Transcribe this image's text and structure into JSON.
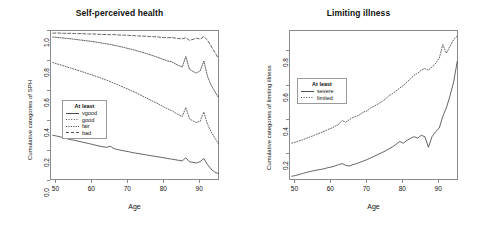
{
  "chart_data": [
    {
      "type": "line",
      "title": "Self-perceived health",
      "xlabel": "Age",
      "ylabel": "Cumulative categories of SPH",
      "xlim": [
        48.5,
        95.5
      ],
      "ylim": [
        0.0,
        1.0
      ],
      "xticks": [
        50,
        60,
        70,
        80,
        90
      ],
      "yticks": [
        "0.0",
        "0.2",
        "0.4",
        "0.6",
        "0.8",
        "1.0"
      ],
      "grid": false,
      "legend": {
        "title": "At least",
        "position": "center-left",
        "entries": [
          {
            "name": "vgood",
            "dash": "none"
          },
          {
            "name": "good",
            "dash": "dotted"
          },
          {
            "name": "fair",
            "dash": "dash-dot"
          },
          {
            "name": "bad",
            "dash": "dashed"
          }
        ]
      },
      "x": [
        49,
        50,
        51,
        52,
        53,
        54,
        55,
        56,
        57,
        58,
        59,
        60,
        61,
        62,
        63,
        64,
        65,
        66,
        67,
        68,
        69,
        70,
        71,
        72,
        73,
        74,
        75,
        76,
        77,
        78,
        79,
        80,
        81,
        82,
        83,
        84,
        85,
        86,
        87,
        88,
        89,
        90,
        91,
        92,
        93,
        94,
        95
      ],
      "series": [
        {
          "name": "bad",
          "dash": "dashed",
          "values": [
            0.985,
            0.987,
            0.986,
            0.985,
            0.984,
            0.985,
            0.983,
            0.982,
            0.983,
            0.981,
            0.98,
            0.981,
            0.979,
            0.978,
            0.977,
            0.976,
            0.975,
            0.976,
            0.974,
            0.973,
            0.972,
            0.971,
            0.97,
            0.968,
            0.967,
            0.966,
            0.965,
            0.963,
            0.962,
            0.961,
            0.958,
            0.956,
            0.955,
            0.957,
            0.953,
            0.95,
            0.948,
            0.955,
            0.938,
            0.944,
            0.952,
            0.946,
            0.963,
            0.94,
            0.9,
            0.86,
            0.82
          ]
        },
        {
          "name": "fair",
          "dash": "dash-dot",
          "values": [
            0.96,
            0.958,
            0.955,
            0.953,
            0.95,
            0.948,
            0.945,
            0.942,
            0.939,
            0.936,
            0.933,
            0.93,
            0.926,
            0.922,
            0.918,
            0.914,
            0.91,
            0.905,
            0.9,
            0.895,
            0.889,
            0.883,
            0.877,
            0.871,
            0.864,
            0.857,
            0.85,
            0.842,
            0.834,
            0.826,
            0.817,
            0.808,
            0.8,
            0.795,
            0.782,
            0.77,
            0.76,
            0.83,
            0.745,
            0.73,
            0.72,
            0.735,
            0.8,
            0.7,
            0.64,
            0.6,
            0.56
          ]
        },
        {
          "name": "good",
          "dash": "dotted",
          "values": [
            0.79,
            0.782,
            0.775,
            0.768,
            0.76,
            0.753,
            0.745,
            0.738,
            0.73,
            0.722,
            0.714,
            0.706,
            0.698,
            0.69,
            0.68,
            0.672,
            0.662,
            0.652,
            0.642,
            0.632,
            0.622,
            0.612,
            0.6,
            0.59,
            0.578,
            0.566,
            0.554,
            0.542,
            0.53,
            0.518,
            0.505,
            0.492,
            0.48,
            0.47,
            0.455,
            0.442,
            0.43,
            0.49,
            0.415,
            0.4,
            0.39,
            0.4,
            0.46,
            0.38,
            0.33,
            0.29,
            0.25
          ]
        },
        {
          "name": "vgood",
          "dash": "none",
          "values": [
            0.305,
            0.3,
            0.295,
            0.288,
            0.282,
            0.275,
            0.272,
            0.266,
            0.26,
            0.255,
            0.25,
            0.244,
            0.238,
            0.233,
            0.228,
            0.225,
            0.232,
            0.216,
            0.21,
            0.205,
            0.2,
            0.196,
            0.19,
            0.186,
            0.182,
            0.178,
            0.174,
            0.17,
            0.166,
            0.162,
            0.158,
            0.154,
            0.15,
            0.146,
            0.142,
            0.138,
            0.134,
            0.155,
            0.128,
            0.124,
            0.12,
            0.13,
            0.15,
            0.11,
            0.08,
            0.06,
            0.05
          ]
        }
      ]
    },
    {
      "type": "line",
      "title": "Limiting illness",
      "xlabel": "Age",
      "ylabel": "Cumulative categories of limiting illness",
      "xlim": [
        48.5,
        95.5
      ],
      "ylim": [
        0.04,
        0.92
      ],
      "xticks": [
        50,
        60,
        70,
        80,
        90
      ],
      "yticks": [
        "0.2",
        "0.4",
        "0.6",
        "0.8"
      ],
      "grid": false,
      "legend": {
        "title": "At least",
        "position": "center-left",
        "entries": [
          {
            "name": "severe",
            "dash": "none"
          },
          {
            "name": "limited",
            "dash": "dotted"
          }
        ]
      },
      "x": [
        49,
        50,
        51,
        52,
        53,
        54,
        55,
        56,
        57,
        58,
        59,
        60,
        61,
        62,
        63,
        64,
        65,
        66,
        67,
        68,
        69,
        70,
        71,
        72,
        73,
        74,
        75,
        76,
        77,
        78,
        79,
        80,
        81,
        82,
        83,
        84,
        85,
        86,
        87,
        88,
        89,
        90,
        91,
        92,
        93,
        94,
        95
      ],
      "series": [
        {
          "name": "limited",
          "dash": "dotted",
          "values": [
            0.262,
            0.268,
            0.275,
            0.282,
            0.29,
            0.298,
            0.306,
            0.315,
            0.323,
            0.332,
            0.341,
            0.35,
            0.36,
            0.372,
            0.395,
            0.385,
            0.4,
            0.412,
            0.42,
            0.43,
            0.445,
            0.452,
            0.47,
            0.48,
            0.492,
            0.505,
            0.52,
            0.54,
            0.552,
            0.568,
            0.585,
            0.6,
            0.62,
            0.64,
            0.66,
            0.672,
            0.69,
            0.7,
            0.69,
            0.71,
            0.73,
            0.76,
            0.84,
            0.79,
            0.83,
            0.87,
            0.89
          ]
        },
        {
          "name": "severe",
          "dash": "none",
          "values": [
            0.068,
            0.072,
            0.078,
            0.084,
            0.09,
            0.095,
            0.1,
            0.104,
            0.108,
            0.112,
            0.118,
            0.122,
            0.128,
            0.136,
            0.142,
            0.132,
            0.128,
            0.136,
            0.142,
            0.15,
            0.158,
            0.166,
            0.176,
            0.186,
            0.196,
            0.206,
            0.216,
            0.228,
            0.24,
            0.255,
            0.272,
            0.262,
            0.278,
            0.29,
            0.3,
            0.292,
            0.308,
            0.3,
            0.238,
            0.3,
            0.33,
            0.35,
            0.42,
            0.47,
            0.54,
            0.62,
            0.74
          ]
        }
      ]
    }
  ],
  "colors": {
    "axis": "#8a8a8a",
    "line": "#222222",
    "text": "#111111",
    "background": "#ffffff"
  }
}
